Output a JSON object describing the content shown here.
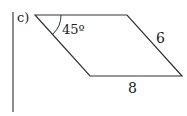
{
  "diagram": {
    "label": "c)",
    "shape": "parallelogram",
    "angle_label": "45º",
    "side_label": "6",
    "base_label": "8",
    "colors": {
      "stroke": "#333333",
      "text": "#222222",
      "background": "#ffffff"
    }
  }
}
